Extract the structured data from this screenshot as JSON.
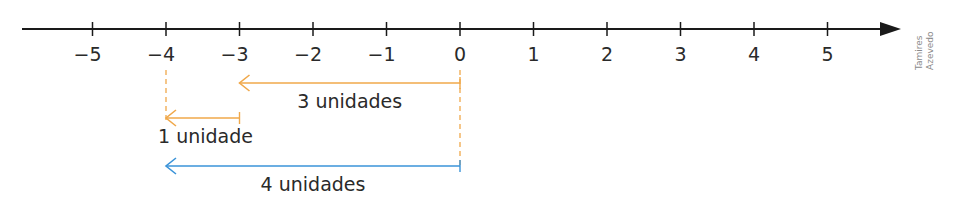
{
  "number_line": {
    "min": -5,
    "max": 5,
    "ticks": [
      {
        "value": -5,
        "label": "−5"
      },
      {
        "value": -4,
        "label": "−4"
      },
      {
        "value": -3,
        "label": "−3"
      },
      {
        "value": -2,
        "label": "−2"
      },
      {
        "value": -1,
        "label": "−1"
      },
      {
        "value": 0,
        "label": "0"
      },
      {
        "value": 1,
        "label": "1"
      },
      {
        "value": 2,
        "label": "2"
      },
      {
        "value": 3,
        "label": "3"
      },
      {
        "value": 4,
        "label": "4"
      },
      {
        "value": 5,
        "label": "5"
      }
    ],
    "axis_color": "#1a1a1a"
  },
  "segments": [
    {
      "from": 0,
      "to": -3,
      "label": "3 unidades",
      "color": "#f0a84a"
    },
    {
      "from": -3,
      "to": -4,
      "label": "1 unidade",
      "color": "#f0a84a"
    },
    {
      "from": 0,
      "to": -4,
      "label": "4 unidades",
      "color": "#3a93d8"
    }
  ],
  "guides": [
    {
      "at": -4,
      "color": "#f0a84a"
    },
    {
      "at": 0,
      "color": "#f0a84a"
    }
  ],
  "credit": {
    "line1": "Tamires",
    "line2": "Azevedo"
  }
}
